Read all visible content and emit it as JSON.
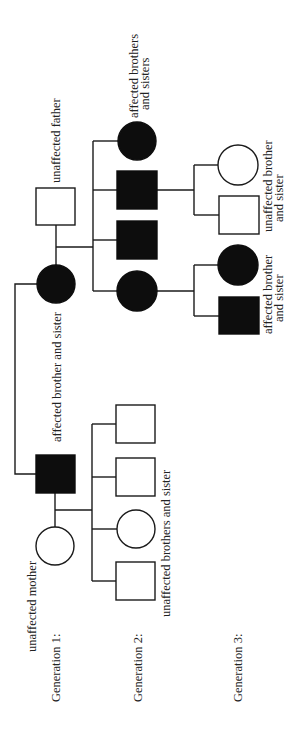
{
  "orientation": "rotated 90 degrees counter-clockwise",
  "colors": {
    "affected": "#0d0d0d",
    "unaffected": "#ffffff",
    "line": "#1a1a1a",
    "text": "#222222"
  },
  "generations": [
    {
      "label": "Generation 1:"
    },
    {
      "label": "Generation 2:"
    },
    {
      "label": "Generation 3:"
    }
  ],
  "labels": {
    "unaffected_mother": "unaffected mother",
    "unaffected_father": "unaffected father",
    "g1_affected_siblings": "affected brother and sister",
    "g2_unaffected_siblings": "unaffected brothers and sister",
    "g2_affected_siblings_line1": "affected brothers",
    "g2_affected_siblings_line2": "and sisters",
    "g3_unaffected_line1": "unaffected brother",
    "g3_unaffected_line2": "and sister",
    "g3_affected_line1": "affected brother",
    "g3_affected_line2": "and sister"
  },
  "individuals": [
    {
      "id": "g1-unaffected-mother",
      "generation": 1,
      "sex": "female",
      "affected": false
    },
    {
      "id": "g1-affected-father",
      "generation": 1,
      "sex": "male",
      "affected": true
    },
    {
      "id": "g1-affected-mother",
      "generation": 1,
      "sex": "female",
      "affected": true
    },
    {
      "id": "g1-unaffected-father",
      "generation": 1,
      "sex": "male",
      "affected": false
    },
    {
      "id": "g2-a-son-1",
      "generation": 2,
      "sex": "male",
      "affected": false
    },
    {
      "id": "g2-a-daughter",
      "generation": 2,
      "sex": "female",
      "affected": false
    },
    {
      "id": "g2-a-son-2",
      "generation": 2,
      "sex": "male",
      "affected": false
    },
    {
      "id": "g2-a-son-3",
      "generation": 2,
      "sex": "male",
      "affected": false
    },
    {
      "id": "g2-b-daughter-1",
      "generation": 2,
      "sex": "female",
      "affected": true
    },
    {
      "id": "g2-b-son-1",
      "generation": 2,
      "sex": "male",
      "affected": true
    },
    {
      "id": "g2-b-son-2",
      "generation": 2,
      "sex": "male",
      "affected": true
    },
    {
      "id": "g2-b-daughter-2",
      "generation": 2,
      "sex": "female",
      "affected": true
    },
    {
      "id": "g3-a-son",
      "generation": 3,
      "sex": "male",
      "affected": true
    },
    {
      "id": "g3-a-daughter",
      "generation": 3,
      "sex": "female",
      "affected": true
    },
    {
      "id": "g3-b-son",
      "generation": 3,
      "sex": "male",
      "affected": false
    },
    {
      "id": "g3-b-daughter",
      "generation": 3,
      "sex": "female",
      "affected": false
    }
  ]
}
